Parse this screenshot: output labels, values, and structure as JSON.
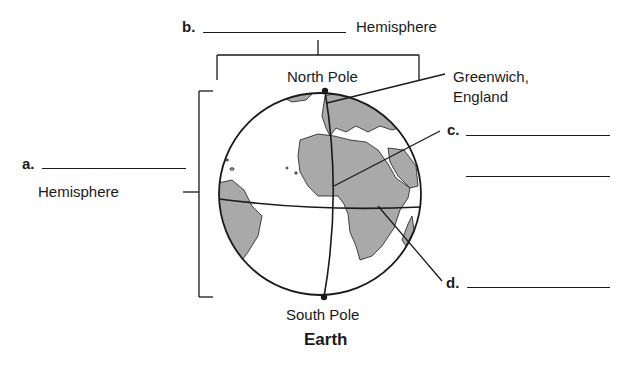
{
  "diagram": {
    "title": "Earth",
    "labels": {
      "north_pole": "North Pole",
      "south_pole": "South Pole",
      "greenwich": [
        "Greenwich,",
        "England"
      ]
    },
    "questions": {
      "a": {
        "letter": "a.",
        "suffix": "Hemisphere",
        "answer": ""
      },
      "b": {
        "letter": "b.",
        "suffix": "Hemisphere",
        "answer": ""
      },
      "c": {
        "letter": "c.",
        "answer": ""
      },
      "d": {
        "letter": "d.",
        "answer": ""
      }
    },
    "colors": {
      "land": "#a9a9a9",
      "ocean": "#ffffff",
      "line": "#1a1a1a"
    }
  }
}
